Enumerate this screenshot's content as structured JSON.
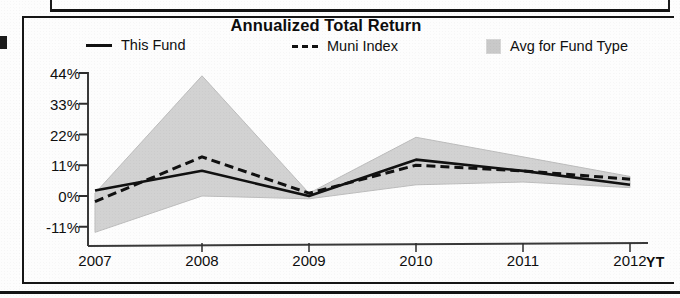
{
  "panel": {
    "title": "Annualized Total Return"
  },
  "legend": {
    "items": [
      {
        "label": "This Fund",
        "marker": "solid-line-swatch",
        "color": "#111111"
      },
      {
        "label": "Muni Index",
        "marker": "dashed-line-swatch",
        "color": "#111111"
      },
      {
        "label": "Avg for Fund Type",
        "marker": "area-swatch",
        "color": "#c9c9c9"
      }
    ]
  },
  "axis": {
    "x_extra_label": "YT"
  },
  "chart_data": {
    "type": "line",
    "title": "Annualized Total Return",
    "xlabel": "",
    "ylabel": "",
    "categories": [
      "2007",
      "2008",
      "2009",
      "2010",
      "2011",
      "2012"
    ],
    "x_tick_labels": [
      "2007",
      "2008",
      "2009",
      "2010",
      "2011",
      "2012"
    ],
    "y_tick_labels": [
      "44%",
      "33%",
      "22%",
      "11%",
      "0%",
      "-11%"
    ],
    "y_tick_values": [
      44,
      33,
      22,
      11,
      0,
      -11
    ],
    "ylim": [
      -13,
      46
    ],
    "grid": false,
    "legend_position": "top",
    "series": [
      {
        "name": "This Fund",
        "style": "solid",
        "color": "#111111",
        "values": [
          2,
          9,
          0,
          13,
          9,
          4
        ]
      },
      {
        "name": "Muni Index",
        "style": "dashed",
        "color": "#111111",
        "values": [
          -2,
          14,
          1,
          11,
          9,
          6
        ]
      },
      {
        "name": "Avg for Fund Type",
        "style": "band",
        "color": "#c9c9c9",
        "band_upper": [
          1,
          43,
          1,
          21,
          14,
          7
        ],
        "band_lower": [
          -13,
          0,
          -1,
          4,
          5,
          3
        ]
      }
    ]
  }
}
